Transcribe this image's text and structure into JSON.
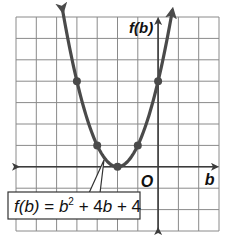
{
  "chart_data": {
    "type": "line",
    "title": "",
    "function": "f(b) = b^2 + 4b + 4",
    "xlabel": "b",
    "ylabel": "f(b)",
    "origin_label": "O",
    "xlim": [
      -7,
      3
    ],
    "ylim": [
      -3,
      7
    ],
    "grid": true,
    "grid_step": 1,
    "tick_labels_shown": false,
    "points": [
      {
        "x": -4,
        "y": 4
      },
      {
        "x": -3,
        "y": 1
      },
      {
        "x": -2,
        "y": 0
      },
      {
        "x": -1,
        "y": 1
      },
      {
        "x": 0,
        "y": 4
      }
    ],
    "vertex": {
      "x": -2,
      "y": 0
    },
    "curve_extends_with_arrows": true,
    "annotation": {
      "text": "f(b) = b² + 4b + 4",
      "parts": {
        "lhs": "f(b)",
        "eq": " = ",
        "b": "b",
        "sq": "2",
        "rest_plus1": " + 4",
        "b2": "b",
        "rest_plus2": " + 4"
      },
      "points_to": {
        "x": -2.7,
        "y": 0.5
      }
    },
    "colors": {
      "curve": "#4a4a4a",
      "grid": "#8a8a8a",
      "axis": "#3c3c3c"
    }
  },
  "axes": {
    "x_label": "b",
    "y_label": "f(b)",
    "origin": "O"
  }
}
